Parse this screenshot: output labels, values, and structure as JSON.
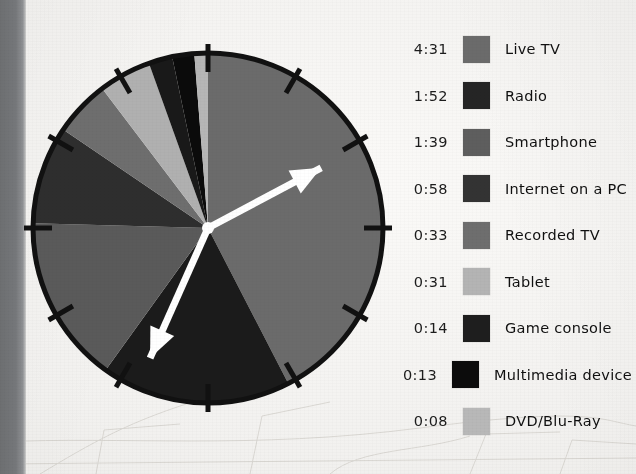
{
  "figure": {
    "type": "clock-pie-chart",
    "background_color": "#f2f1ef",
    "left_strip_color": "#74767a",
    "dial": {
      "face_outline_color": "#111111",
      "outline_width_px": 5,
      "tick_count": 12,
      "tick_color": "#111111",
      "hands": [
        {
          "name": "hour-hand",
          "angle_deg": 62,
          "length_ratio": 0.72,
          "color": "#ffffff"
        },
        {
          "name": "minute-hand",
          "angle_deg": 204,
          "length_ratio": 0.8,
          "color": "#ffffff"
        }
      ],
      "hub_color": "#ffffff"
    }
  },
  "chart_data": {
    "type": "pie",
    "title": "",
    "subtitle": "",
    "xlabel": "",
    "ylabel": "",
    "units": "hours:minutes per day",
    "total": "10:59",
    "legend_position": "right",
    "grid": false,
    "categories": [
      "Live TV",
      "Radio",
      "Smartphone",
      "Internet on a PC",
      "Recorded TV",
      "Tablet",
      "Game console",
      "Multimedia device",
      "DVD/Blu-Ray"
    ],
    "value_labels": [
      "4:31",
      "1:52",
      "1:39",
      "0:58",
      "0:33",
      "0:31",
      "0:14",
      "0:13",
      "0:08"
    ],
    "values_minutes": [
      271,
      112,
      99,
      58,
      33,
      31,
      14,
      13,
      8
    ],
    "colors": [
      "#6b6b6b",
      "#1b1b1b",
      "#5a5a5a",
      "#2e2e2e",
      "#6e6e6e",
      "#b0b0b0",
      "#191919",
      "#0b0b0b",
      "#b6b6b6"
    ],
    "start_angle_deg": 0,
    "direction": "clockwise"
  },
  "legend": {
    "rows": [
      {
        "time": "4:31",
        "label": "Live TV",
        "color": "#6b6b6b"
      },
      {
        "time": "1:52",
        "label": "Radio",
        "color": "#252525"
      },
      {
        "time": "1:39",
        "label": "Smartphone",
        "color": "#5e5e5e"
      },
      {
        "time": "0:58",
        "label": "Internet on a PC",
        "color": "#333333"
      },
      {
        "time": "0:33",
        "label": "Recorded TV",
        "color": "#6e6e6e"
      },
      {
        "time": "0:31",
        "label": "Tablet",
        "color": "#b4b4b4"
      },
      {
        "time": "0:14",
        "label": "Game console",
        "color": "#1e1e1e"
      },
      {
        "time": "0:13",
        "label": "Multimedia device",
        "color": "#0c0c0c"
      },
      {
        "time": "0:08",
        "label": "DVD/Blu-Ray",
        "color": "#b8b8b8"
      }
    ]
  }
}
